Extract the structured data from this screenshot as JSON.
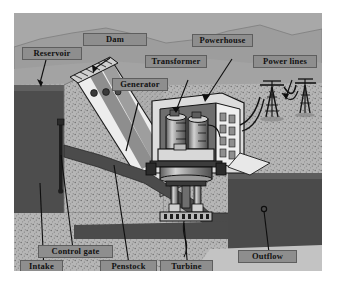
{
  "figure": {
    "background_color": "#ffffff",
    "canvas_color": "#9c9c9c",
    "style": "grayscale cutaway illustration"
  },
  "palette": {
    "sky": "#a8a8a8",
    "far_hill": "#9a9a9a",
    "ground_speckle": "#b4b4b4",
    "water_dark": "#4a4a4a",
    "water_mid": "#5a5a5a",
    "concrete_light": "#e6e6e6",
    "metal_mid": "#8a8a8a",
    "outline": "#1a1a1a",
    "label_box": "#8e8e8e",
    "label_text": "#111111"
  },
  "labels": [
    {
      "id": "reservoir",
      "text": "Reservoir",
      "x": 22,
      "y": 47,
      "w": 58
    },
    {
      "id": "dam",
      "text": "Dam",
      "x": 83,
      "y": 33,
      "w": 62
    },
    {
      "id": "generator",
      "text": "Generator",
      "x": 112,
      "y": 78,
      "w": 54
    },
    {
      "id": "transformer",
      "text": "Transformer",
      "x": 145,
      "y": 55,
      "w": 60
    },
    {
      "id": "powerhouse",
      "text": "Powerhouse",
      "x": 192,
      "y": 34,
      "w": 59
    },
    {
      "id": "power-lines",
      "text": "Power lines",
      "x": 253,
      "y": 55,
      "w": 62
    },
    {
      "id": "control-gate",
      "text": "Control gate",
      "x": 38,
      "y": 245,
      "w": 73
    },
    {
      "id": "intake",
      "text": "Intake",
      "x": 20,
      "y": 260,
      "w": 41
    },
    {
      "id": "penstock",
      "text": "Penstock",
      "x": 100,
      "y": 260,
      "w": 55
    },
    {
      "id": "turbine",
      "text": "Turbine",
      "x": 160,
      "y": 260,
      "w": 51
    },
    {
      "id": "outflow",
      "text": "Outflow",
      "x": 238,
      "y": 250,
      "w": 57
    }
  ],
  "components": {
    "reservoir": "impounded water body behind the dam",
    "dam": "sloped concrete dam face with crest walkway",
    "intake": "water entry at the base of the reservoir",
    "control_gate": "vertical gate rod controlling intake flow",
    "penstock": "sloping pressure tunnel carrying water to the turbine",
    "turbine": "runner assembly at the bottom of the shaft",
    "generator": "rotating machine above the turbine",
    "transformer": "two cylindrical transformers inside the powerhouse",
    "powerhouse": "building enclosing generator and transformers",
    "power_lines": "two transmission towers with catenary conductors",
    "outflow": "tailrace water discharged downstream"
  }
}
